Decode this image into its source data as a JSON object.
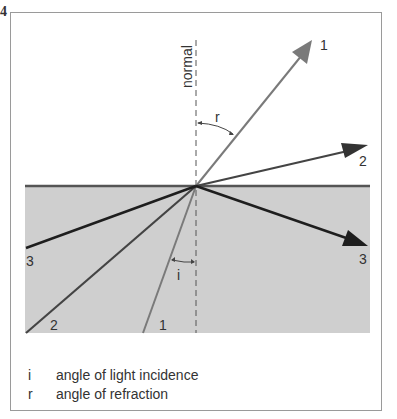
{
  "figure": {
    "number": "4",
    "normal_label": "normal",
    "angle_labels": {
      "refraction": "r",
      "incidence": "i"
    },
    "rays": [
      {
        "id": "1",
        "top_label": "1",
        "bottom_label": "1",
        "color": "#7a7a7a"
      },
      {
        "id": "2",
        "top_label": "2",
        "bottom_label": "2",
        "color": "#444444"
      },
      {
        "id": "3",
        "top_label": "3",
        "bottom_label": "3",
        "color": "#1e1e1e"
      }
    ],
    "medium_color": "#cfcfcf",
    "surface_color": "#555555"
  },
  "legend": [
    {
      "symbol": "i",
      "text": "angle of light incidence"
    },
    {
      "symbol": "r",
      "text": "angle of refraction"
    }
  ]
}
